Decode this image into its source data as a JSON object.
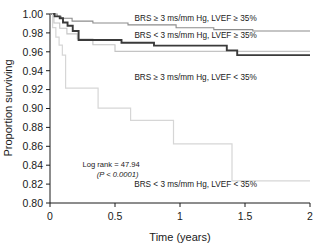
{
  "chart_data": {
    "type": "line",
    "title": "",
    "subtitle": "",
    "xlabel": "Time (years)",
    "ylabel": "Proportion surviving",
    "xlim": [
      0,
      2
    ],
    "ylim": [
      0.8,
      1.0
    ],
    "xticks": [
      "0",
      "0.5",
      "1",
      "1.5",
      "2"
    ],
    "xtick_values": [
      0,
      0.5,
      1,
      1.5,
      2
    ],
    "yticks": [
      "0.80",
      "0.82",
      "0.84",
      "0.86",
      "0.88",
      "0.90",
      "0.92",
      "0.94",
      "0.96",
      "0.98",
      "1.00"
    ],
    "ytick_values": [
      0.8,
      0.82,
      0.84,
      0.86,
      0.88,
      0.9,
      0.92,
      0.94,
      0.96,
      0.98,
      1.0
    ],
    "grid": false,
    "legend_position": "inline-right",
    "annotations": [
      {
        "text": "Log rank = 47.94",
        "x": 0.47,
        "y": 0.838
      },
      {
        "text": "(P < 0.0001)",
        "x": 0.52,
        "y": 0.827
      }
    ],
    "series": [
      {
        "name": "BRS ≥ 3 ms/mm Hg, LVEF ≥ 35%",
        "color": "#8c8c8c",
        "width": 1.1,
        "label_x": 1.12,
        "label_y": 0.9925,
        "step_x": [
          0,
          0.055,
          0.055,
          0.085,
          0.085,
          0.17,
          0.17,
          0.33,
          0.33,
          0.6,
          0.6,
          0.97,
          0.97,
          1.26,
          1.26,
          1.56,
          1.56,
          2.0
        ],
        "step_y": [
          1.0,
          1.0,
          0.9975,
          0.9975,
          0.9955,
          0.9955,
          0.9925,
          0.9925,
          0.9905,
          0.9905,
          0.9885,
          0.9885,
          0.9855,
          0.9855,
          0.9835,
          0.9835,
          0.982,
          0.982
        ]
      },
      {
        "name": "BRS < 3 ms/mm Hg, LVEF ≥ 35%",
        "color": "#c4c4c4",
        "width": 1.1,
        "label_x": 1.12,
        "label_y": 0.9745,
        "step_x": [
          0,
          0.03,
          0.03,
          0.075,
          0.075,
          0.13,
          0.13,
          0.21,
          0.21,
          0.33,
          0.33,
          0.5,
          0.5,
          2.0
        ],
        "step_y": [
          1.0,
          1.0,
          0.9905,
          0.9905,
          0.985,
          0.985,
          0.979,
          0.979,
          0.9735,
          0.9735,
          0.9675,
          0.9675,
          0.9605,
          0.9605
        ]
      },
      {
        "name": "BRS ≥ 3 ms/mm Hg, LVEF < 35%",
        "color": "#3a3a3a",
        "width": 1.9,
        "label_x": 1.12,
        "label_y": 0.9305,
        "step_x": [
          0,
          0.035,
          0.035,
          0.075,
          0.075,
          0.1,
          0.1,
          0.135,
          0.135,
          0.175,
          0.175,
          0.22,
          0.22,
          0.55,
          0.55,
          0.8,
          0.8,
          1.36,
          1.36,
          1.44,
          1.44,
          2.0
        ],
        "step_y": [
          1.0,
          1.0,
          0.9975,
          0.9975,
          0.9955,
          0.9955,
          0.991,
          0.991,
          0.9875,
          0.9875,
          0.982,
          0.982,
          0.9725,
          0.9725,
          0.9695,
          0.9695,
          0.9665,
          0.9665,
          0.9615,
          0.9615,
          0.9565,
          0.9565
        ]
      },
      {
        "name": "BRS < 3 ms/mm Hg, LVEF < 35%",
        "color": "#d6d6d6",
        "width": 1.2,
        "label_x": 1.12,
        "label_y": 0.8165,
        "step_x": [
          0,
          0.02,
          0.02,
          0.045,
          0.045,
          0.07,
          0.07,
          0.095,
          0.095,
          0.12,
          0.12,
          0.37,
          0.37,
          0.62,
          0.62,
          0.95,
          0.95,
          1.4,
          1.4,
          2.0
        ],
        "step_y": [
          1.0,
          1.0,
          0.9855,
          0.9855,
          0.9755,
          0.9755,
          0.967,
          0.967,
          0.9565,
          0.9565,
          0.9215,
          0.9215,
          0.9005,
          0.9005,
          0.8875,
          0.8875,
          0.8625,
          0.8625,
          0.8235,
          0.8235
        ]
      }
    ]
  },
  "axes": {
    "x_title": "Time (years)",
    "y_title": "Proportion surviving"
  }
}
